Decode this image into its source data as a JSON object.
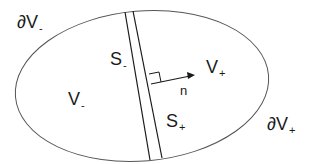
{
  "diagram": {
    "labels": {
      "boundary_minus": {
        "main": "∂V",
        "sub": "-"
      },
      "boundary_plus": {
        "main": "∂V",
        "sub": "+"
      },
      "volume_minus": {
        "main": "V",
        "sub": "-"
      },
      "volume_plus": {
        "main": "V",
        "sub": "+"
      },
      "surface_minus": {
        "main": "S",
        "sub": "-"
      },
      "surface_plus": {
        "main": "S",
        "sub": "+"
      },
      "normal": "n"
    },
    "colors": {
      "stroke": "#1a1a1a",
      "ellipse": "#555555",
      "background": "#ffffff"
    }
  }
}
